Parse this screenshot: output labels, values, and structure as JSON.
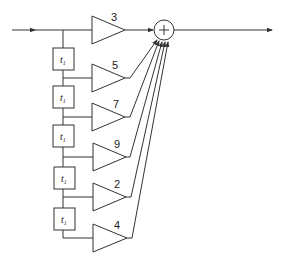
{
  "diagram": {
    "type": "tapped-delay-line FIR filter",
    "summer": {
      "symbol": "+"
    },
    "delay_label": "t",
    "delay_subscript": "1",
    "taps": [
      {
        "gain": "3"
      },
      {
        "gain": "5"
      },
      {
        "gain": "7"
      },
      {
        "gain": "9"
      },
      {
        "gain": "2"
      },
      {
        "gain": "4"
      }
    ],
    "delays_count": 5
  }
}
